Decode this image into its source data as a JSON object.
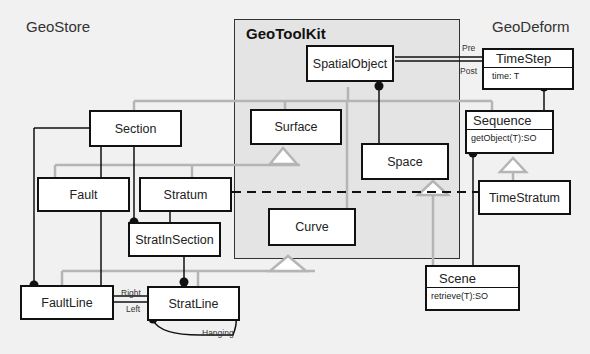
{
  "packages": {
    "geostore": "GeoStore",
    "geotoolkit": "GeoToolKit",
    "geodeform": "GeoDeform"
  },
  "classes": {
    "spatial_object": "SpatialObject",
    "surface": "Surface",
    "space": "Space",
    "curve": "Curve",
    "section": "Section",
    "fault": "Fault",
    "stratum": "Stratum",
    "strat_in_section": "StratInSection",
    "fault_line": "FaultLine",
    "strat_line": "StratLine",
    "time_step": {
      "name": "TimeStep",
      "attribute": "time: T"
    },
    "sequence": {
      "name": "Sequence",
      "operation": "getObject(T):SO"
    },
    "time_stratum": "TimeStratum",
    "scene": {
      "name": "Scene",
      "operation": "retrieve(T):SO"
    }
  },
  "role_labels": {
    "pre": "Pre",
    "post": "Post",
    "right": "Right",
    "left": "Left",
    "hanging": "Hanging"
  },
  "colors": {
    "background": "#f1f1f1",
    "package": "#e4e4e4",
    "association": "#111111",
    "generalization": "#b5b5b5"
  }
}
